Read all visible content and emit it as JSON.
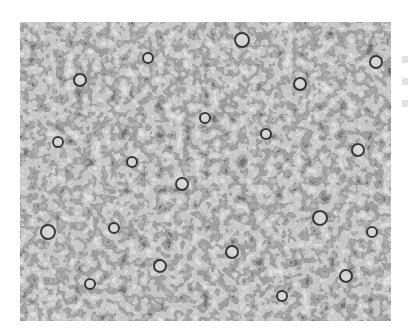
{
  "figure": {
    "colors": {
      "background": "#ffffff",
      "dark_stain": "#1e1e1e",
      "mid_tone": "#8a8a8a",
      "pale_cells": "#d4d4d4"
    }
  },
  "edge_text": {
    "note": "Partially cropped text fragments at right edge, illegible"
  }
}
